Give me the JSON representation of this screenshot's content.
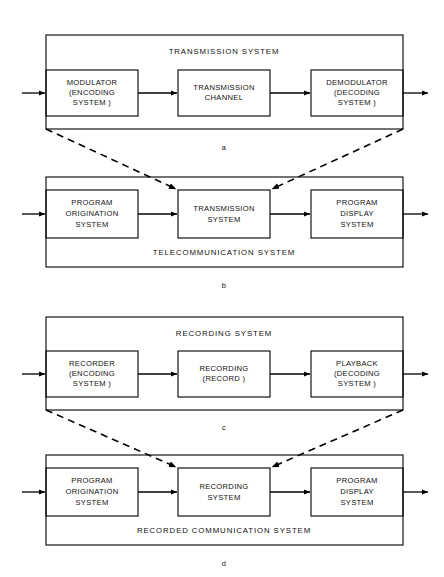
{
  "figure": {
    "background_color": "#ffffff",
    "line_color": "#000000",
    "text_color": "#111111"
  },
  "panels": [
    {
      "id": "a",
      "letter": "a",
      "system_label": "TRANSMISSION  SYSTEM",
      "label_position": "top",
      "blocks": [
        {
          "lines": [
            "MODULATOR",
            "(ENCODING",
            "SYSTEM )"
          ]
        },
        {
          "lines": [
            "TRANSMISSION",
            "CHANNEL"
          ]
        },
        {
          "lines": [
            "DEMODULATOR",
            "(DECODING",
            "SYSTEM )"
          ]
        }
      ]
    },
    {
      "id": "b",
      "letter": "b",
      "system_label": "TELECOMMUNICATION  SYSTEM",
      "label_position": "bottom",
      "blocks": [
        {
          "lines": [
            "PROGRAM",
            "ORIGINATION",
            "SYSTEM"
          ]
        },
        {
          "lines": [
            "TRANSMISSION",
            "SYSTEM"
          ]
        },
        {
          "lines": [
            "PROGRAM",
            "DISPLAY",
            "SYSTEM"
          ]
        }
      ]
    },
    {
      "id": "c",
      "letter": "c",
      "system_label": "RECORDING  SYSTEM",
      "label_position": "top",
      "blocks": [
        {
          "lines": [
            "RECORDER",
            "(ENCODING",
            "SYSTEM )"
          ]
        },
        {
          "lines": [
            "RECORDING",
            "(RECORD )"
          ]
        },
        {
          "lines": [
            "PLAYBACK",
            "(DECODING",
            "SYSTEM )"
          ]
        }
      ]
    },
    {
      "id": "d",
      "letter": "d",
      "system_label": "RECORDED  COMMUNICATION  SYSTEM",
      "label_position": "bottom",
      "blocks": [
        {
          "lines": [
            "PROGRAM",
            "ORIGINATION",
            "SYSTEM"
          ]
        },
        {
          "lines": [
            "RECORDING",
            "SYSTEM"
          ]
        },
        {
          "lines": [
            "PROGRAM",
            "DISPLAY",
            "SYSTEM"
          ]
        }
      ]
    }
  ],
  "connectors": [
    {
      "from_panel": "a",
      "to_panel": "b",
      "style": "dashed",
      "arrowheads": 2
    },
    {
      "from_panel": "c",
      "to_panel": "d",
      "style": "dashed",
      "arrowheads": 2
    }
  ]
}
